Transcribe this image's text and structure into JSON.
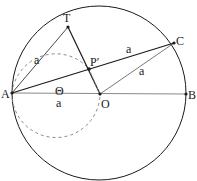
{
  "diagram": {
    "type": "geometry",
    "points": {
      "A": {
        "label": "A",
        "x": 12,
        "y": 93
      },
      "O": {
        "label": "O",
        "x": 100,
        "y": 94
      },
      "B": {
        "label": "B",
        "x": 186,
        "y": 94
      },
      "T": {
        "label": "T",
        "x": 68,
        "y": 27
      },
      "P": {
        "label": "P′",
        "x": 89,
        "y": 69
      },
      "C": {
        "label": "C",
        "x": 174,
        "y": 43
      }
    },
    "segment_labels": {
      "AT": "a",
      "PC": "a",
      "OC": "a",
      "AO": "a"
    },
    "angle_label": "Θ",
    "colors": {
      "stroke": "#1a1a1a",
      "light_stroke": "#555555",
      "dashed": "#888888",
      "background": "#ffffff"
    }
  }
}
